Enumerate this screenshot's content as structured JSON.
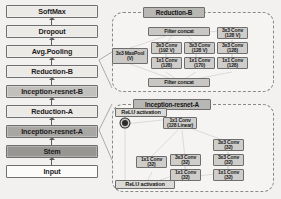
{
  "diagram": {
    "colors": {
      "block_fill_light": "#eceae7",
      "block_fill_mid": "#c2c0bd",
      "block_fill_dark": "#a9a7a4",
      "block_fill_darker": "#989693",
      "block_border": "#6e6e6e",
      "panel_border": "#8c8a87",
      "background": "#f2f1ef",
      "arrow": "#5d5d5d"
    }
  },
  "pipeline": {
    "name": "main-network-stack",
    "direction": "bottom-to-top",
    "blocks": [
      {
        "label": "SoftMax",
        "tone": "light"
      },
      {
        "label": "Dropout",
        "tone": "light"
      },
      {
        "label": "Avg.Pooling",
        "tone": "light"
      },
      {
        "label": "Reduction-B",
        "tone": "light"
      },
      {
        "label": "Inception-resnet-B",
        "tone": "mid"
      },
      {
        "label": "Reduction-A",
        "tone": "light"
      },
      {
        "label": "Inception-resnet-A",
        "tone": "dark"
      },
      {
        "label": "Stem",
        "tone": "darker"
      },
      {
        "label": "Input",
        "tone": "white"
      }
    ]
  },
  "reduction_b_panel": {
    "title": "Reduction-B",
    "top_concat": "Filter concat",
    "bottom_concat": "Filter concat",
    "maxpool": {
      "line1": "3x3 MaxPool",
      "line2": "(V)"
    },
    "branch_b": [
      {
        "line1": "3x3 Conv",
        "line2": "(192 V)"
      },
      {
        "line1": "1x1 Conv",
        "line2": "(128)"
      }
    ],
    "branch_c": [
      {
        "line1": "3x3 Conv",
        "line2": "(128 V)"
      },
      {
        "line1": "1x1 Conv",
        "line2": "(170)"
      }
    ],
    "branch_d": [
      {
        "line1": "3x3 Conv",
        "line2": "(128 V)"
      },
      {
        "line1": "3x3 Conv",
        "line2": "(128)"
      },
      {
        "line1": "1x1 Conv",
        "line2": "(128)"
      }
    ]
  },
  "inception_resnet_a_panel": {
    "title": "Inception-resnet-A",
    "relu_top": "ReLU activation",
    "relu_bottom": "ReLU activation",
    "sum_node": "residual-add",
    "linear_conv": {
      "line1": "1x1 Conv",
      "line2": "(128 Linear)"
    },
    "branch_a": [
      {
        "line1": "1x1 Conv",
        "line2": "(32)"
      }
    ],
    "branch_b": [
      {
        "line1": "3x3 Conv",
        "line2": "(32)"
      },
      {
        "line1": "1x1 Conv",
        "line2": "(32)"
      }
    ],
    "branch_c": [
      {
        "line1": "3x3 Conv",
        "line2": "(32)"
      },
      {
        "line1": "3x3 Conv",
        "line2": "(32)"
      },
      {
        "line1": "1x1 Conv",
        "line2": "(32)"
      }
    ]
  }
}
